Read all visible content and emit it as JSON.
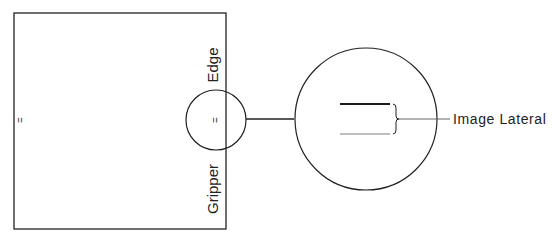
{
  "diagram": {
    "sheet": {
      "label_left": "=",
      "label_center": "="
    },
    "edge_label": {
      "word1": "Gripper",
      "word2": "Edge"
    },
    "callout_label": "Image Lateral",
    "colors": {
      "stroke": "#222222",
      "dark_line": "#1a1a1a",
      "light_line": "#a8a8a8",
      "background": "#ffffff"
    }
  }
}
